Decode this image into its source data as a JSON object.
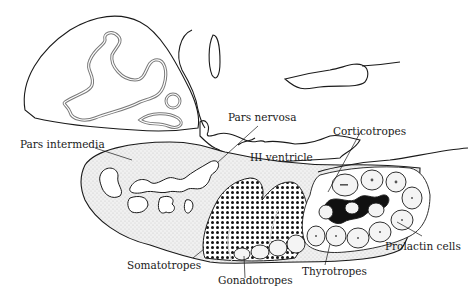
{
  "diagram": {
    "colors": {
      "ink": "#1a1a1a",
      "stipple": "#e4e4e4",
      "background": "#ffffff"
    },
    "labels": {
      "pars_nervosa": "Pars nervosa",
      "pars_intermedia": "Pars intermedia",
      "iii_ventricle": "III ventricle",
      "corticotropes": "Corticotropes",
      "prolactin_cells": "Prolactin cells",
      "thyrotropes": "Thyrotropes",
      "gonadotropes": "Gonadotropes",
      "somatotropes": "Somatotropes"
    }
  }
}
